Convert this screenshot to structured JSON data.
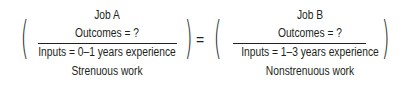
{
  "equation": {
    "left": {
      "title": "Job A",
      "numerator": "Outcomes = ?",
      "denominator_line1": "Inputs = 0–1 years experience",
      "denominator_line2": "Strenuous work"
    },
    "operator": "=",
    "right": {
      "title": "Job B",
      "numerator": "Outcomes = ?",
      "denominator_line1": "Inputs = 1–3 years experience",
      "denominator_line2": "Nonstrenuous work"
    },
    "open_paren": "(",
    "close_paren": ")"
  }
}
